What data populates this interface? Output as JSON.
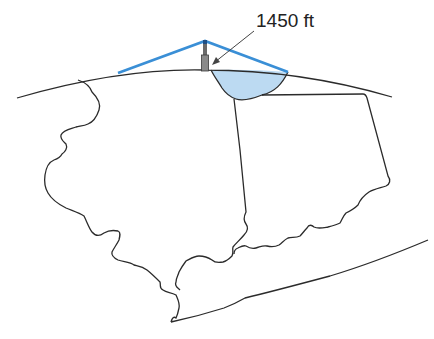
{
  "diagram": {
    "annotation": {
      "height_label": "1450 ft",
      "target": "antenna-tower"
    },
    "colors": {
      "line_of_sight": "#3a8fd6",
      "coverage_fill": "#bcdaf2",
      "outline": "#2b2b2b",
      "tower": "#8a8a8a"
    },
    "elements": [
      "earth-curvature-arc",
      "antenna-tower",
      "line-of-sight-rays",
      "coverage-area",
      "state-outlines",
      "coastline"
    ]
  }
}
